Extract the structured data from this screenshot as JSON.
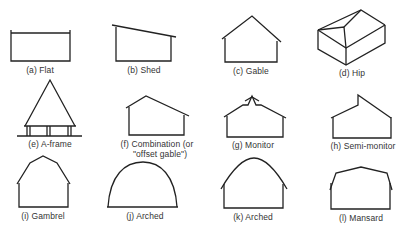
{
  "figure": {
    "items": [
      {
        "id": "a",
        "label": "(a) Flat"
      },
      {
        "id": "b",
        "label": "(b) Shed"
      },
      {
        "id": "c",
        "label": "(c) Gable"
      },
      {
        "id": "d",
        "label": "(d) Hip"
      },
      {
        "id": "e",
        "label": "(e) A-frame"
      },
      {
        "id": "f",
        "label_line1": "(f) Combination (or",
        "label_line2": "\"offset gable\")"
      },
      {
        "id": "g",
        "label": "(g) Monitor"
      },
      {
        "id": "h",
        "label": "(h) Semi-monitor"
      },
      {
        "id": "i",
        "label": "(i) Gambrel"
      },
      {
        "id": "j",
        "label": "(j) Arched"
      },
      {
        "id": "k",
        "label": "(k) Arched"
      },
      {
        "id": "l",
        "label": "(l) Mansard"
      }
    ],
    "stroke_color": "#222222"
  }
}
